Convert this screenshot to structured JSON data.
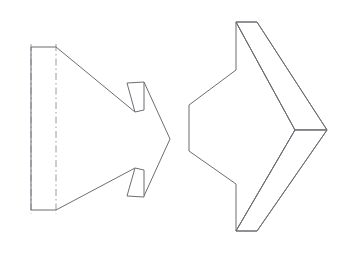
{
  "document": {
    "title": "Arrow Solid — Two Views",
    "background_color": "#ffffff",
    "width": 355,
    "height": 253
  },
  "style": {
    "solid_line_color": "#6d6d74",
    "center_line_color": "#9a9aa2",
    "line_width": 1,
    "center_line_dash": "7 3 1.5 3"
  },
  "figures": [
    {
      "id": "left-view",
      "name": "orthographic-arrow-view",
      "label": "",
      "description": "Flat orthographic view of arrow-shaped prism with dash-dot centre lines",
      "outline_points": "31,47 56,47 170,139 56,210 31,210",
      "paths": {
        "left_block_top": "M 31 47 L 56 47",
        "left_block_bottom": "M 31 210 L 56 210",
        "left_block_edge": "M 31 47 L 31 210",
        "upper_diagonal": "M 56 47 L 135 112",
        "lower_diagonal": "M 56 210 L 135 168",
        "tip_upper": "M 144 82 L 170 139",
        "tip_lower": "M 170 139 L 144 196",
        "notch_upper": "M 127 83 L 144 82 L 144 110 L 135 112 Z",
        "notch_lower": "M 135 168 L 144 170 L 144 197 L 127 196 Z",
        "center_line_a": "M 31 44 L 31 214",
        "center_line_b": "M 56 44 L 56 214"
      }
    },
    {
      "id": "right-view",
      "name": "pictorial-arrow-view",
      "label": "",
      "description": "Pictorial (isometric) view of the same arrow solid showing depth",
      "paths": {
        "front_profile": "M 236 22 L 236 70 L 189 105 L 189 151 L 236 184 L 236 231 L 295 130 Z",
        "top_face": "M 236 22 L 257 22 L 327 130 L 295 130 Z",
        "right_face": "M 295 130 L 327 130 L 257 231 L 236 231 Z",
        "top_edge": "M 236 22 L 257 22",
        "bottom_edge": "M 236 231 L 257 231",
        "upper_back_diag": "M 257 22 L 327 130",
        "lower_back_diag": "M 327 130 L 257 231",
        "upper_front_diag": "M 236 22 L 295 130",
        "lower_front_diag": "M 295 130 L 236 231",
        "tip_edge": "M 295 130 L 327 130"
      }
    }
  ],
  "annotations": {
    "visible_text": []
  }
}
